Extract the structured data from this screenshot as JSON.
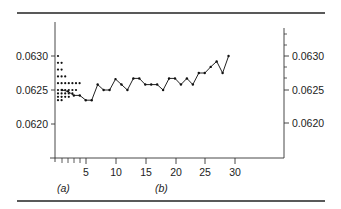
{
  "figure": {
    "panel_labels": {
      "a": "(a)",
      "b": "(b)"
    },
    "left_axis": {
      "ticks": [
        "0.0630",
        "0.0625",
        "0.0620"
      ]
    },
    "right_axis": {
      "ticks": [
        "0.0630",
        "0.0625",
        "0.0620"
      ]
    },
    "x_axis": {
      "ticks": [
        "5",
        "10",
        "15",
        "20",
        "25",
        "30"
      ]
    }
  },
  "chart_data": [
    {
      "panel": "(a)",
      "type": "scatter",
      "title": "",
      "description": "Dot plot (histogram of values) stacked horizontally from the left axis",
      "ylabel": "",
      "xlabel": "",
      "ylim": [
        0.0617,
        0.0633
      ],
      "bins": [
        0.063,
        0.06295,
        0.0629,
        0.06285,
        0.0628,
        0.06275,
        0.0627,
        0.06265,
        0.0626,
        0.06255,
        0.0625,
        0.06245,
        0.0624,
        0.06235
      ],
      "counts": [
        1,
        0,
        2,
        0,
        2,
        0,
        3,
        0,
        7,
        0,
        6,
        5,
        4,
        2
      ]
    },
    {
      "panel": "(b)",
      "type": "line",
      "title": "",
      "xlabel": "",
      "ylabel": "",
      "xlim": [
        0,
        31
      ],
      "ylim": [
        0.0617,
        0.0633
      ],
      "grid": false,
      "x": [
        1,
        2,
        3,
        4,
        5,
        6,
        7,
        8,
        9,
        10,
        11,
        12,
        13,
        14,
        15,
        16,
        17,
        18,
        19,
        20,
        21,
        22,
        23,
        24,
        25,
        26,
        27,
        28,
        29
      ],
      "values": [
        0.0625,
        0.06248,
        0.06242,
        0.06242,
        0.06235,
        0.06235,
        0.06258,
        0.0625,
        0.0625,
        0.06266,
        0.06258,
        0.0625,
        0.06267,
        0.06267,
        0.06258,
        0.06258,
        0.06258,
        0.0625,
        0.06267,
        0.06267,
        0.06258,
        0.06267,
        0.06258,
        0.06275,
        0.06275,
        0.06284,
        0.06292,
        0.06275,
        0.063,
        0.06287
      ]
    }
  ]
}
